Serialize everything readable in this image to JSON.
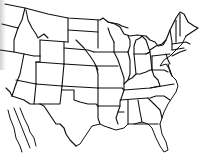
{
  "map": {
    "subject": "Outline map of the contiguous United States with state borders",
    "style": "black line drawing on white background",
    "colors": {
      "background": "#ffffff",
      "line": "#111111"
    },
    "labels": []
  }
}
